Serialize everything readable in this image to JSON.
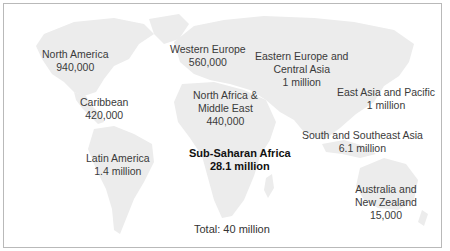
{
  "map": {
    "land_color": "#ececec",
    "border_color": "#b9b9b9",
    "regions": [
      {
        "name": "North  America",
        "value": "940,000"
      },
      {
        "name": "Caribbean",
        "value": "420,000"
      },
      {
        "name": "Latin America",
        "value": "1.4 million"
      },
      {
        "name": "Western Europe",
        "value": "560,000"
      },
      {
        "name_lines": [
          "North Africa &",
          "Middle East"
        ],
        "value": "440,000"
      },
      {
        "name_lines": [
          "Eastern Europe and",
          "Central Asia"
        ],
        "value": "1 million"
      },
      {
        "name": "East Asia and Pacific",
        "value": "1 million"
      },
      {
        "name": "Sub-Saharan Africa",
        "value": "28.1 million",
        "emphasis": "bold"
      },
      {
        "name": "South and Southeast Asia",
        "value": "6.1 million"
      },
      {
        "name_lines": [
          "Australia and",
          "New Zealand"
        ],
        "value": "15,000"
      }
    ],
    "total_label": "Total: 40 million"
  }
}
